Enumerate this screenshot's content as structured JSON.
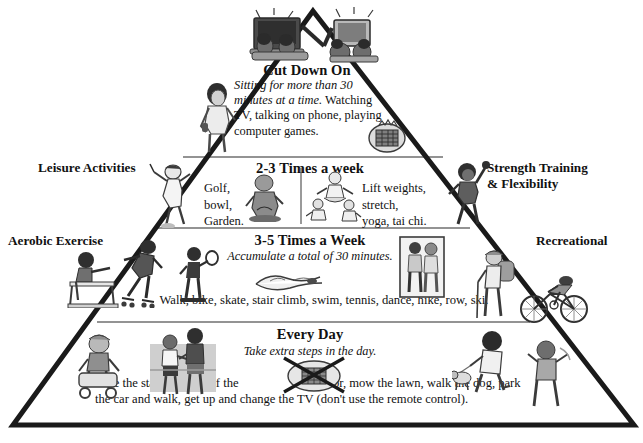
{
  "colors": {
    "outline": "#1a1a1a",
    "divider": "#6b6b6b",
    "text": "#111111",
    "art_dark": "#3b3b3b",
    "art_mid": "#8d8d8d",
    "art_light": "#c8c8c8"
  },
  "side_labels": {
    "left_upper": "Leisure Activities",
    "left_lower": "Aerobic Exercise",
    "right_upper_line1": "Strength Training",
    "right_upper_line2": "& Flexibility",
    "right_lower": "Recreational"
  },
  "tiers": [
    {
      "id": "cut-down-on",
      "title": "Cut Down On",
      "body_italic": "Sitting for more than 30 minutes at a time.",
      "body_roman": "Watching TV, talking on phone, playing computer games.",
      "art": [
        "tv-and-computer-kids-icon",
        "person-on-phone-icon",
        "board-game-icon"
      ]
    },
    {
      "id": "two-three-times",
      "title": "2-3 Times a week",
      "left_items": [
        "Golf,",
        "bowl,",
        "Garden."
      ],
      "right_items": [
        "Lift weights,",
        "stretch,",
        "yoga, tai chi."
      ],
      "art": [
        "golfer-icon",
        "gardener-icon",
        "yoga-group-icon",
        "weightlifter-icon"
      ]
    },
    {
      "id": "three-five-times",
      "title": "3-5 Times a Week",
      "subtitle": "Accumulate a total of 30 minutes.",
      "list": "Walk, bike, skate, stair climb, swim, tennis, dance, hike, row, ski.",
      "art": [
        "rower-icon",
        "skater-icon",
        "tennis-player-icon",
        "swimmer-icon",
        "walking-couple-icon",
        "hiker-icon",
        "cyclist-icon"
      ]
    },
    {
      "id": "every-day",
      "title": "Every Day",
      "subtitle": "Take extra steps in the day.",
      "list_line1_a": "Take the stairs instead of the",
      "list_line1_b": "elevator, mow the lawn, walk the dog, park",
      "list_line2": "the car and walk, get up and change the TV (don't use the remote control).",
      "art": [
        "person-with-stroller-icon",
        "couple-walking-stairs-icon",
        "no-remote-crossed-out-icon",
        "dog-walker-icon",
        "person-walking-icon"
      ]
    }
  ]
}
